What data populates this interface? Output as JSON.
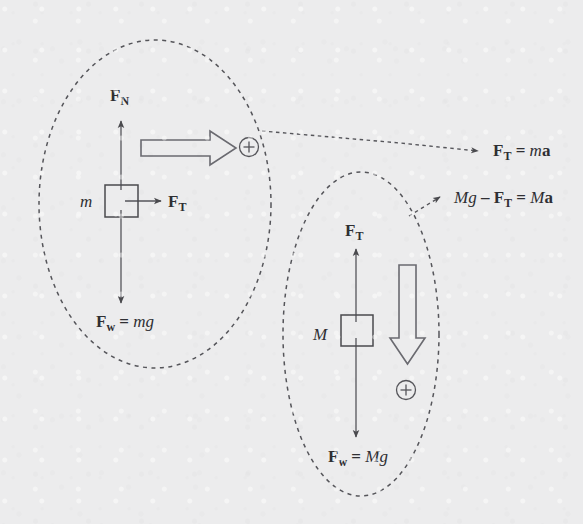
{
  "figure": {
    "type": "physics-free-body-diagram",
    "background_color": "#ececed",
    "ink_color": "#4a4a4e",
    "width": 583,
    "height": 524
  },
  "system_left": {
    "name": "mass-m-on-surface",
    "mass_label": "m",
    "boundary": "dashed-ellipse",
    "forces": [
      {
        "name": "normal-force",
        "symbol": "F",
        "subscript": "N",
        "direction": "up"
      },
      {
        "name": "tension-force",
        "symbol": "F",
        "subscript": "T",
        "direction": "right"
      },
      {
        "name": "weight-force",
        "symbol": "F",
        "subscript": "w",
        "equals": "= ",
        "value": "mg",
        "direction": "down"
      }
    ],
    "acceleration_direction_label": "+",
    "acceleration_arrow": "hollow-arrow-right"
  },
  "system_right": {
    "name": "hanging-mass-M",
    "mass_label": "M",
    "boundary": "dashed-ellipse",
    "forces": [
      {
        "name": "tension-force",
        "symbol": "F",
        "subscript": "T",
        "direction": "up"
      },
      {
        "name": "weight-force",
        "symbol": "F",
        "subscript": "w",
        "equals": "= ",
        "value": "Mg",
        "direction": "down"
      }
    ],
    "acceleration_direction_label": "+",
    "acceleration_arrow": "hollow-arrow-down"
  },
  "equations": [
    {
      "name": "equation-mass-m",
      "parts": [
        {
          "text": "F",
          "style": "bold"
        },
        {
          "text": "T",
          "style": "subscript"
        },
        {
          "text": " = ",
          "style": "roman"
        },
        {
          "text": "m",
          "style": "italic"
        },
        {
          "text": "a",
          "style": "bold"
        }
      ],
      "plain": "F_T = ma"
    },
    {
      "name": "equation-mass-M",
      "parts": [
        {
          "text": "Mg",
          "style": "italic"
        },
        {
          "text": " – ",
          "style": "roman"
        },
        {
          "text": "F",
          "style": "bold"
        },
        {
          "text": "T",
          "style": "subscript"
        },
        {
          "text": " = ",
          "style": "roman"
        },
        {
          "text": "M",
          "style": "italic"
        },
        {
          "text": "a",
          "style": "bold"
        }
      ],
      "plain": "Mg - F_T = Ma"
    }
  ],
  "text": {
    "F": "F",
    "N_sub": "N",
    "T_sub": "T",
    "w_sub": "w",
    "eq": "=",
    "minus": "–",
    "mg": "mg",
    "Mg": "Mg",
    "m_italic": "m",
    "M_italic": "M",
    "a_bold": "a",
    "plus_sign": "+",
    "m_mass": "m",
    "M_mass": "M"
  }
}
